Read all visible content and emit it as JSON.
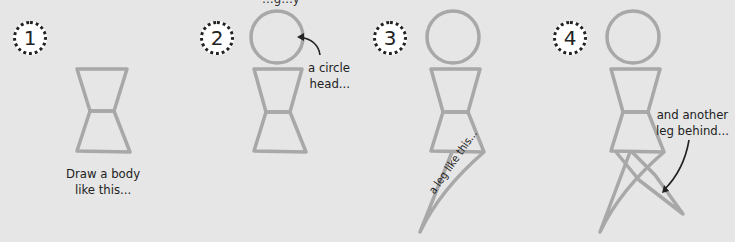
{
  "top_text": "…g…y",
  "steps": [
    {
      "number": "1",
      "caption_line1": "Draw a body",
      "caption_line2": "like this..."
    },
    {
      "number": "2",
      "caption_line1": "a circle",
      "caption_line2": "head..."
    },
    {
      "number": "3",
      "caption": "a leg like this..."
    },
    {
      "number": "4",
      "caption_line1": "and another",
      "caption_line2": "leg behind..."
    }
  ],
  "colors": {
    "background": "#e6e6e6",
    "stroke": "#a8a8a8",
    "text": "#222222"
  }
}
